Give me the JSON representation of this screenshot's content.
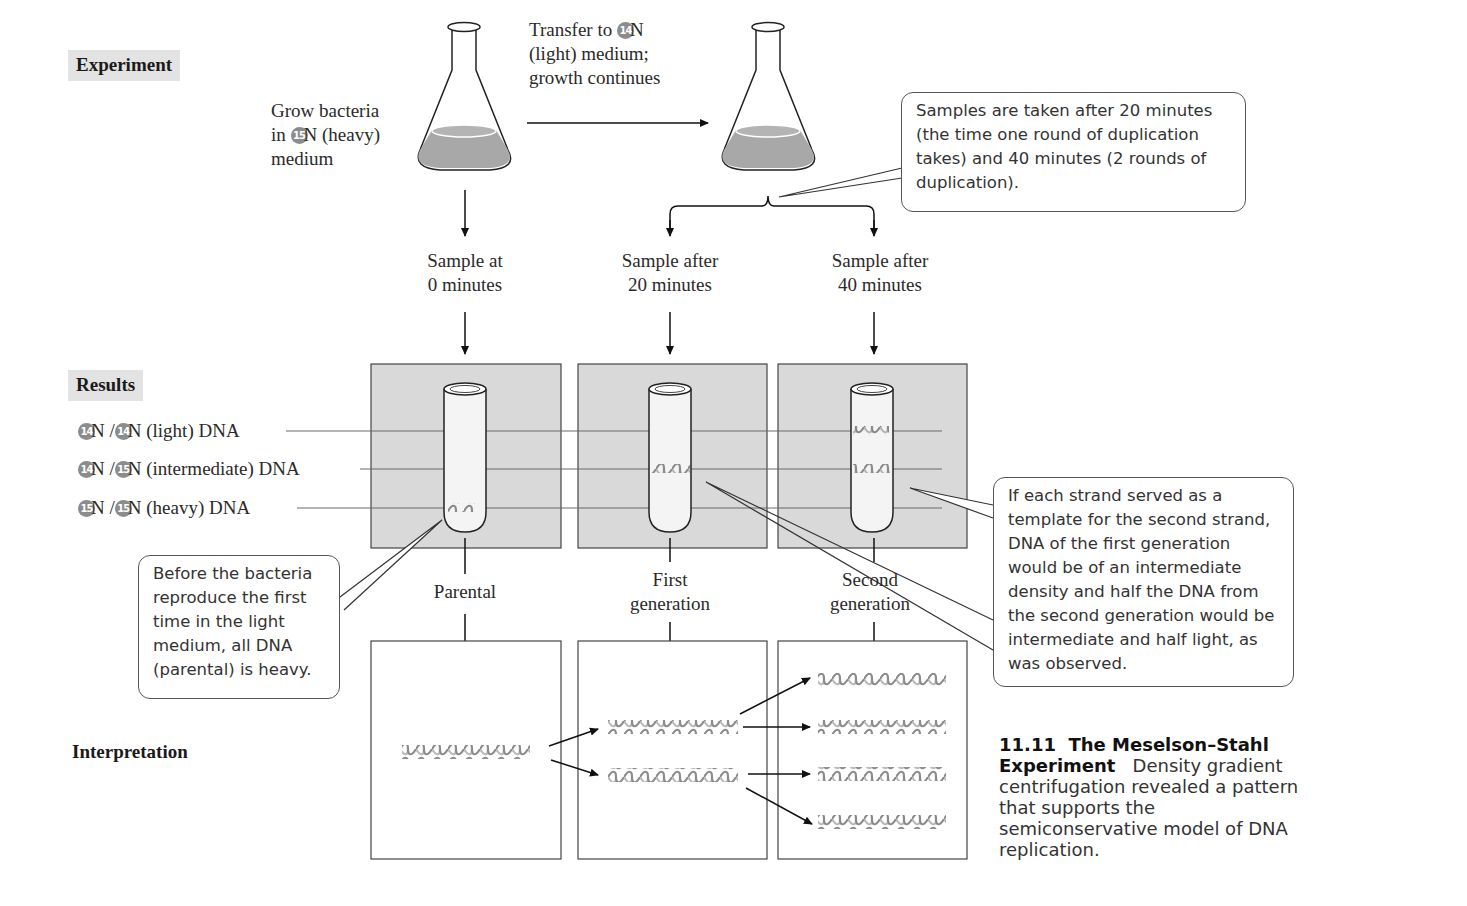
{
  "sections": {
    "experiment": "Experiment",
    "results": "Results",
    "interpretation": "Interpretation"
  },
  "experiment": {
    "grow_text": {
      "line1": "Grow bacteria",
      "line2_pre": "in ",
      "isotope": "15",
      "line2_post": "N (heavy)",
      "line3": "medium"
    },
    "transfer_text": {
      "line1_pre": "Transfer to ",
      "isotope": "14",
      "line1_post": "N",
      "line2": "(light) medium;",
      "line3": "growth continues"
    },
    "samples_callout": "Samples are taken after 20 minutes (the time one round of duplication takes) and 40 minutes (2 rounds of duplication).",
    "samples": [
      {
        "line1": "Sample at",
        "line2": "0 minutes"
      },
      {
        "line1": "Sample after",
        "line2": "20 minutes"
      },
      {
        "line1": "Sample after",
        "line2": "40 minutes"
      }
    ]
  },
  "results": {
    "bands": [
      {
        "iso_a": "14",
        "iso_b": "14",
        "label": "N (light) DNA"
      },
      {
        "iso_a": "14",
        "iso_b": "15",
        "label": "N (intermediate) DNA"
      },
      {
        "iso_a": "15",
        "iso_b": "15",
        "label": "N (heavy) DNA"
      }
    ],
    "generations": [
      {
        "line1": "Parental",
        "line2": ""
      },
      {
        "line1": "First",
        "line2": "generation"
      },
      {
        "line1": "Second",
        "line2": "generation"
      }
    ],
    "parental_callout": "Before the bacteria reproduce the first time in the light medium, all DNA (parental) is heavy.",
    "template_callout": "If each strand served as a template for the second strand, DNA of the first generation would be of an intermediate density and half the DNA from the second generation would be intermediate and half light, as was observed."
  },
  "caption": {
    "number": "11.11",
    "title": "The Meselson–Stahl Experiment",
    "body": "Density gradient centrifugation revealed a pattern that supports the semiconservative model of DNA replication."
  },
  "colors": {
    "panel_gray": "#d9d9d9",
    "liquid_gray": "#a8a8a8",
    "dna_gray": "#8a8a8a",
    "tag_bg": "#e3e3e3"
  }
}
